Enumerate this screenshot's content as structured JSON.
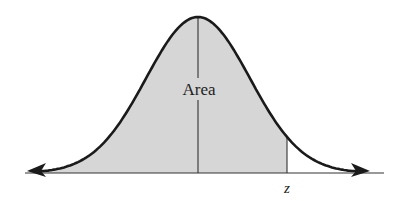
{
  "diagram": {
    "area_label": "Area",
    "z_label": "z",
    "colors": {
      "shade": "#d6d6d6",
      "curve": "#1a1a1a",
      "axis": "#333333",
      "background": "#ffffff"
    },
    "geometry": {
      "baseline_y": 173,
      "mean_x": 198,
      "peak_y": 17,
      "z_x": 287,
      "sigma_px": 52
    }
  }
}
